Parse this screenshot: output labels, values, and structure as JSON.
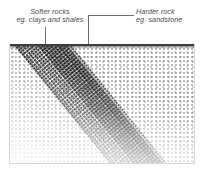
{
  "diagram": {
    "type": "cross-section",
    "annotations": [
      {
        "id": "softer-rocks",
        "line1": "Softer rocks",
        "line2": "eg. clays and shales",
        "leader": "vertical-arrow-down",
        "points_to": "light stippled matrix left of the band"
      },
      {
        "id": "harder-rock",
        "line1": "Harder rock",
        "line2": "eg. sandstone",
        "leader": "elbow-with-square-marker",
        "points_to": "dark diagonal band"
      }
    ],
    "features": {
      "ground_surface": "horizontal dark line across the top of the section",
      "soft_matrix": "fine random stipple, density fading toward lower left",
      "hard_band": "darker dense stipple band dipping from upper left to lower right",
      "band_dip_degrees": 39
    },
    "colors": {
      "paper": "#ffffff",
      "text": "#4a4a4a",
      "leader": "#6e6e6e",
      "marker": "#2b2b2b",
      "ground_line": "#3c3c3c",
      "soft_stipple": "#5a5a5a",
      "hard_stipple": "#262626",
      "frame": "#d8d8d8"
    }
  }
}
